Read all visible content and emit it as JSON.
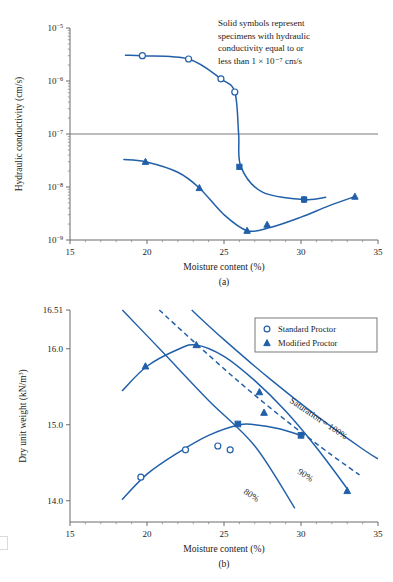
{
  "figure_a": {
    "panel_label": "(a)",
    "xlabel": "Moisture content (%)",
    "ylabel_main": "Hydraulic conductivity (cm/s)",
    "annotation_lines": [
      "Solid symbols represent",
      "specimens with hydraulic",
      "conductivity equal to or",
      "less than 1 × 10⁻⁷ cm/s"
    ],
    "xticks": [
      "15",
      "20",
      "25",
      "30",
      "35"
    ],
    "yticks": [
      "10⁻⁵",
      "10⁻⁶",
      "10⁻⁷",
      "10⁻⁸",
      "10⁻⁹"
    ],
    "reference_line_value": "1e-7"
  },
  "figure_b": {
    "panel_label": "(b)",
    "xlabel": "Moisture content (%)",
    "ylabel_main": "Dry unit weight (kN/m³)",
    "xticks": [
      "15",
      "20",
      "25",
      "30",
      "35"
    ],
    "yticks": [
      "16.51",
      "16.0",
      "15.0",
      "14.0"
    ],
    "legend": [
      {
        "label": "Standard Proctor",
        "marker": "open-circle"
      },
      {
        "label": "Modified Proctor",
        "marker": "filled-triangle"
      }
    ],
    "saturation_labels": [
      {
        "text": "Saturation = 100%",
        "value": 100
      },
      {
        "text": "90%",
        "value": 90
      },
      {
        "text": "80%",
        "value": 80
      }
    ]
  },
  "colors": {
    "data_blue": "#2160a8",
    "axis_gray": "#6b6b6b",
    "text": "#1a1a1a",
    "background": "#ffffff"
  },
  "chart_data": [
    {
      "type": "line",
      "id": "hydraulic-conductivity",
      "title": "",
      "xlabel": "Moisture content (%)",
      "ylabel": "Hydraulic conductivity (cm/s)",
      "xlim": [
        15,
        35
      ],
      "ylim": [
        1e-09,
        1e-05
      ],
      "yscale": "log",
      "grid": false,
      "reference_lines": [
        {
          "y": 1e-07,
          "color": "#7a7a7a"
        }
      ],
      "annotation": "Solid symbols represent specimens with hydraulic conductivity equal to or less than 1 × 10⁻⁷ cm/s",
      "series": [
        {
          "name": "Standard Proctor",
          "marker": "open-circle",
          "points": [
            {
              "x": 19.7,
              "y": 3e-06
            },
            {
              "x": 22.7,
              "y": 2.6e-06
            },
            {
              "x": 24.8,
              "y": 1.1e-06
            },
            {
              "x": 25.7,
              "y": 6.2e-07
            },
            {
              "x": 26.0,
              "y": 2.4e-08
            },
            {
              "x": 30.2,
              "y": 5.8e-09
            }
          ],
          "path_x": [
            18.6,
            19.7,
            22.7,
            24.8,
            25.7,
            25.95,
            26.1,
            27.5,
            30.2,
            31.6
          ],
          "path_y": [
            3.05e-06,
            3e-06,
            2.6e-06,
            1.1e-06,
            6.2e-07,
            1e-07,
            2.4e-08,
            8e-09,
            5.8e-09,
            6.4e-09
          ]
        },
        {
          "name": "Modified Proctor",
          "marker": "filled-triangle",
          "points": [
            {
              "x": 19.9,
              "y": 3e-08
            },
            {
              "x": 23.4,
              "y": 9.6e-09
            },
            {
              "x": 26.5,
              "y": 1.5e-09
            },
            {
              "x": 27.8,
              "y": 1.95e-09
            },
            {
              "x": 33.5,
              "y": 6.6e-09
            }
          ],
          "path_x": [
            18.5,
            19.9,
            22.0,
            23.4,
            25.0,
            26.5,
            28.0,
            30.0,
            31.8,
            33.5
          ],
          "path_y": [
            3.3e-08,
            3e-08,
            1.9e-08,
            9.6e-09,
            3e-09,
            1.5e-09,
            1.72e-09,
            2.7e-09,
            4.4e-09,
            6.6e-09
          ]
        }
      ]
    },
    {
      "type": "line",
      "id": "compaction-curves",
      "title": "",
      "xlabel": "Moisture content (%)",
      "ylabel": "Dry unit weight (kN/m³)",
      "xlim": [
        15,
        35
      ],
      "ylim": [
        13.72,
        16.51
      ],
      "yscale": "linear",
      "grid": false,
      "series": [
        {
          "name": "Standard Proctor",
          "marker": "open-circle",
          "points": [
            {
              "x": 19.6,
              "y": 14.31
            },
            {
              "x": 22.5,
              "y": 14.67
            },
            {
              "x": 24.6,
              "y": 14.72
            },
            {
              "x": 25.4,
              "y": 14.67
            },
            {
              "x": 25.9,
              "y": 15.01
            },
            {
              "x": 30.0,
              "y": 14.86
            }
          ],
          "path_x": [
            18.4,
            20.0,
            22.0,
            24.0,
            26.0,
            27.0,
            28.5,
            30.0
          ],
          "path_y": [
            14.02,
            14.35,
            14.63,
            14.86,
            15.0,
            15.0,
            14.95,
            14.86
          ]
        },
        {
          "name": "Modified Proctor",
          "marker": "filled-triangle",
          "points": [
            {
              "x": 19.9,
              "y": 15.77
            },
            {
              "x": 23.2,
              "y": 16.05
            },
            {
              "x": 27.3,
              "y": 15.43
            },
            {
              "x": 27.6,
              "y": 15.16
            },
            {
              "x": 33.0,
              "y": 14.13
            }
          ],
          "path_x": [
            18.4,
            20.0,
            22.0,
            23.2,
            25.0,
            27.0,
            29.0,
            31.0,
            33.0
          ],
          "path_y": [
            15.45,
            15.77,
            15.99,
            16.05,
            15.9,
            15.58,
            15.18,
            14.7,
            14.16
          ]
        },
        {
          "name": "Saturation = 100%",
          "type": "saturation",
          "linestyle": "solid",
          "path_x": [
            22.9,
            25.0,
            28.0,
            31.0,
            34.0,
            35.0
          ],
          "path_y": [
            16.51,
            16.12,
            15.6,
            15.12,
            14.68,
            14.55
          ]
        },
        {
          "name": "90%",
          "type": "saturation",
          "linestyle": "dashed",
          "path_x": [
            20.8,
            23.0,
            26.0,
            29.0,
            32.0,
            33.8
          ],
          "path_y": [
            16.51,
            16.1,
            15.56,
            15.06,
            14.6,
            14.34
          ]
        },
        {
          "name": "80%",
          "type": "saturation",
          "linestyle": "solid",
          "path_x": [
            18.4,
            21.0,
            24.0,
            27.0,
            29.6
          ],
          "path_y": [
            16.51,
            15.96,
            15.32,
            14.72,
            13.9
          ]
        }
      ]
    }
  ]
}
